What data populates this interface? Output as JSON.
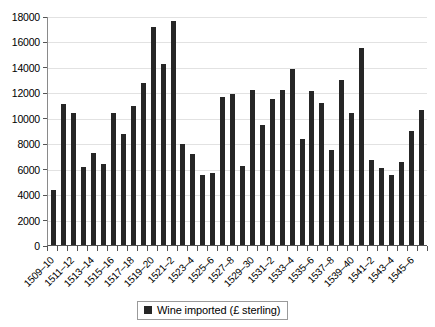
{
  "chart_data": {
    "type": "bar",
    "title": "",
    "xlabel": "",
    "ylabel": "",
    "ylim": [
      0,
      18000
    ],
    "ytick_step": 2000,
    "yticks": [
      0,
      2000,
      4000,
      6000,
      8000,
      10000,
      12000,
      14000,
      16000,
      18000
    ],
    "grid": true,
    "legend_position": "bottom-center",
    "series_name": "Wine imported (£ sterling)",
    "bar_color": "#262626",
    "label_every_n": 2,
    "categories": [
      "1509–10",
      "1510–11",
      "1511–12",
      "1512–13",
      "1513–14",
      "1514–15",
      "1515–16",
      "1516–17",
      "1517–18",
      "1518–19",
      "1519–20",
      "1520–1",
      "1521–2",
      "1522–3",
      "1523–4",
      "1524–5",
      "1525–6",
      "1526–7",
      "1527–8",
      "1528–9",
      "1529–30",
      "1530–1",
      "1531–2",
      "1532–3",
      "1533–4",
      "1534–5",
      "1535–6",
      "1536–7",
      "1537–8",
      "1538–9",
      "1539–40",
      "1540–1",
      "1541–2",
      "1542–3",
      "1543–4",
      "1544–5",
      "1545–6",
      "1546–7"
    ],
    "values": [
      4300,
      11050,
      10400,
      6150,
      7250,
      6350,
      10350,
      8700,
      10950,
      12700,
      17150,
      14200,
      17600,
      7950,
      7150,
      5500,
      5650,
      11600,
      11900,
      6250,
      12150,
      9400,
      11500,
      12200,
      13800,
      8300,
      12100,
      11150,
      7500,
      13000,
      10400,
      15500,
      6700,
      6050,
      5500,
      6500,
      8950,
      10600
    ],
    "tick_labels_visible": [
      "1509–10",
      "1511–12",
      "1513–14",
      "1515–16",
      "1517–18",
      "1519–20",
      "1521–2",
      "1523–4",
      "1525–6",
      "1527–8",
      "1529–30",
      "1531–2",
      "1533–4",
      "1535–6",
      "1537–8",
      "1539–40",
      "1541–2",
      "1543–4",
      "1545–6"
    ]
  },
  "legend": {
    "items": [
      {
        "label": "Wine imported (£ sterling)",
        "swatch_name": "legend-swatch-wine"
      }
    ]
  }
}
